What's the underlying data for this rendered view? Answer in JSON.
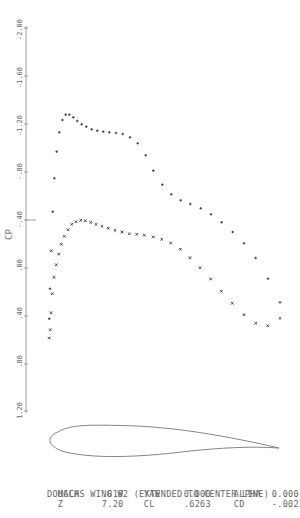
{
  "chart_data": {
    "type": "scatter",
    "title": "DOUGLAS WING W2 (EXTENDED TO CENTER LINE)",
    "xlabel": "",
    "ylabel": "CP",
    "y_ticks": [
      "-2.00",
      "-1.60",
      "-1.20",
      "-.80",
      "-.40",
      ".00",
      ".40",
      ".80",
      "1.20"
    ],
    "ylim": [
      -2.0,
      1.2
    ],
    "y_inverted": true,
    "grid": false,
    "legend": null,
    "series": [
      {
        "name": "upper surface",
        "marker": "+",
        "x_over_c": [
          0.0,
          0.003,
          0.01,
          0.02,
          0.03,
          0.045,
          0.06,
          0.08,
          0.1,
          0.12,
          0.14,
          0.17,
          0.2,
          0.23,
          0.26,
          0.29,
          0.32,
          0.36,
          0.4,
          0.44,
          0.48,
          0.52,
          0.56,
          0.6,
          0.64,
          0.68,
          0.72,
          0.76,
          0.8,
          0.84,
          0.88,
          0.93,
          0.98
        ],
        "cp": [
          -0.02,
          -0.38,
          -0.75,
          -1.02,
          -1.14,
          -1.18,
          -1.22,
          -1.23,
          -1.23,
          -1.2,
          -1.17,
          -1.14,
          -1.12,
          -1.11,
          -1.1,
          -1.09,
          -1.08,
          -1.05,
          -1.0,
          -0.9,
          -0.77,
          -0.65,
          -0.57,
          -0.52,
          -0.49,
          -0.45,
          -0.4,
          -0.33,
          -0.25,
          -0.16,
          -0.04,
          0.13,
          0.33
        ]
      },
      {
        "name": "lower surface",
        "marker": "x",
        "x_over_c": [
          0.0,
          0.003,
          0.01,
          0.02,
          0.03,
          0.045,
          0.06,
          0.08,
          0.1,
          0.12,
          0.14,
          0.17,
          0.2,
          0.23,
          0.26,
          0.29,
          0.32,
          0.36,
          0.4,
          0.44,
          0.48,
          0.52,
          0.56,
          0.6,
          0.64,
          0.68,
          0.72,
          0.76,
          0.8,
          0.84,
          0.88,
          0.93,
          0.98
        ],
        "cp": [
          0.58,
          0.51,
          0.37,
          0.21,
          0.07,
          -0.07,
          -0.13,
          -0.22,
          -0.28,
          -0.32,
          -0.35,
          -0.38,
          -0.38,
          -0.37,
          -0.35,
          -0.33,
          -0.31,
          -0.29,
          -0.27,
          -0.24,
          -0.23,
          -0.22,
          -0.21,
          -0.18,
          -0.16,
          -0.13,
          -0.05,
          0.04,
          0.15,
          0.27,
          0.37,
          0.45,
          0.48
        ]
      }
    ],
    "inset": "airfoil section outline below plot",
    "annotations": {
      "line1": "DOUGLAS WING W2 (EXTENDED TO CENTER LINE)",
      "MACH": ".819",
      "YAW": "0.000",
      "ALPHA": "0.000",
      "Z": "7.20",
      "CL": ".6263",
      "CD": "-.0022"
    }
  },
  "plot": {
    "axis_label": "CP",
    "ticks": [
      {
        "label": "-2.00",
        "y": 28
      },
      {
        "label": "-1.60",
        "y": 76
      },
      {
        "label": "-1.20",
        "y": 124
      },
      {
        "label": "-.80",
        "y": 172
      },
      {
        "label": "-.40",
        "y": 220
      },
      {
        "label": ".00",
        "y": 268
      },
      {
        "label": ".40",
        "y": 316
      },
      {
        "label": ".80",
        "y": 364
      },
      {
        "label": "1.20",
        "y": 411
      }
    ],
    "upper_points": [
      [
        52.7,
        211.7
      ],
      [
        54.3,
        178.3
      ],
      [
        56.7,
        151.7
      ],
      [
        59.3,
        132.3
      ],
      [
        62.3,
        120
      ],
      [
        65.7,
        114.7
      ],
      [
        69.3,
        114.7
      ],
      [
        73.3,
        117.3
      ],
      [
        77.3,
        121
      ],
      [
        81.7,
        124.3
      ],
      [
        86.3,
        126.7
      ],
      [
        91.7,
        129.3
      ],
      [
        97.3,
        130.7
      ],
      [
        103.3,
        131.7
      ],
      [
        109.3,
        132.3
      ],
      [
        116,
        133
      ],
      [
        122.7,
        134
      ],
      [
        130,
        137.3
      ],
      [
        137.7,
        143.3
      ],
      [
        145.7,
        155.3
      ],
      [
        153.3,
        170.7
      ],
      [
        162.3,
        184.7
      ],
      [
        171.3,
        194.3
      ],
      [
        180.7,
        200.3
      ],
      [
        190.3,
        204
      ],
      [
        200.7,
        208.3
      ],
      [
        211,
        214.3
      ],
      [
        221.7,
        222.3
      ],
      [
        232.7,
        232
      ],
      [
        244,
        243.3
      ],
      [
        255.7,
        258
      ],
      [
        268,
        278.7
      ],
      [
        280,
        302.3
      ],
      [
        50,
        288.7
      ],
      [
        49.3,
        318.7
      ]
    ],
    "lower_points": [
      [
        49.3,
        338
      ],
      [
        50.3,
        329.7
      ],
      [
        51,
        312.7
      ],
      [
        52.3,
        293.7
      ],
      [
        54,
        277.3
      ],
      [
        56.3,
        264.7
      ],
      [
        58.7,
        254
      ],
      [
        51.3,
        250.7
      ],
      [
        61.3,
        244.3
      ],
      [
        64.3,
        236.3
      ],
      [
        68,
        229.7
      ],
      [
        71.7,
        224.3
      ],
      [
        76,
        221.7
      ],
      [
        80.7,
        220.3
      ],
      [
        85.3,
        220.7
      ],
      [
        90.7,
        222.3
      ],
      [
        96,
        224.3
      ],
      [
        102,
        226.3
      ],
      [
        108.3,
        228.3
      ],
      [
        115,
        230.3
      ],
      [
        122,
        232
      ],
      [
        129.3,
        233.7
      ],
      [
        136.7,
        234.3
      ],
      [
        144.3,
        235.3
      ],
      [
        153.3,
        237
      ],
      [
        161.7,
        239.3
      ],
      [
        170.7,
        243
      ],
      [
        180.3,
        249.3
      ],
      [
        190,
        257.7
      ],
      [
        200,
        267.7
      ],
      [
        210.7,
        279
      ],
      [
        221.3,
        291.3
      ],
      [
        232.3,
        303.3
      ],
      [
        244,
        314.7
      ],
      [
        255.7,
        323.3
      ],
      [
        267.7,
        325.7
      ],
      [
        280,
        318.3
      ]
    ]
  },
  "info": {
    "title": "DOUGLAS WING W2 (EXTENDED TO CENTER LINE)",
    "row1": {
      "k1": "MACH",
      "v1": ".819",
      "k2": "YAW",
      "v2": "0.000",
      "k3": "ALPHA",
      "v3": "0.000"
    },
    "row2": {
      "k1": "Z",
      "v1": "7.20",
      "k2": "CL",
      "v2": ".6263",
      "k3": "CD",
      "v3": "-.0022"
    }
  }
}
